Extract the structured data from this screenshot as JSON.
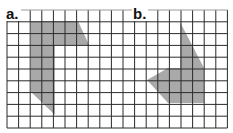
{
  "labels": {
    "a": "a.",
    "b": "b."
  },
  "grid": {
    "x_start": 7,
    "y_start": 10,
    "cols": 19,
    "rows": 10,
    "cell_w": 11.6,
    "cell_h": 11.8,
    "line_color": "#2a2a2a",
    "top_line_color": "#9a9a9a"
  },
  "shapes": {
    "a": {
      "fill": "#9a9a9a",
      "points": "31,21 78,21 89,45 55,45 55,115 31,92"
    },
    "b": {
      "fill": "#9a9a9a",
      "points": "180,22 204,68 204,103 168,103 147,80 168,68 180,68"
    }
  }
}
